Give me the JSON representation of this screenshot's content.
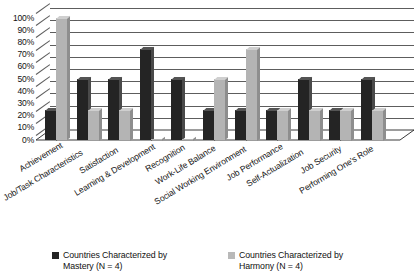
{
  "chart_data": {
    "type": "bar",
    "title": "",
    "subtitle": "",
    "xlabel": "",
    "ylabel": "",
    "ylim": [
      0,
      100
    ],
    "ytick_labels": [
      "100%",
      "90%",
      "80%",
      "70%",
      "60%",
      "50%",
      "40%",
      "30%",
      "20%",
      "10%",
      "0%"
    ],
    "ytick_values": [
      100,
      90,
      80,
      70,
      60,
      50,
      40,
      30,
      20,
      10,
      0
    ],
    "grid": true,
    "grid_axis": "y",
    "legend_position": "bottom",
    "categories": [
      "Achievement",
      "Job/Task Characteristics",
      "Satisfaction",
      "Learning & Development",
      "Recognition",
      "Work-Life Balance",
      "Social Working Environment",
      "Job Performance",
      "Self-Actualization",
      "Job Security",
      "Performing One's Role"
    ],
    "series": [
      {
        "name": "Countries Characterized by Mastery (N = 4)",
        "color": "#242424",
        "values": [
          25,
          50,
          50,
          75,
          50,
          25,
          25,
          25,
          50,
          25,
          50
        ]
      },
      {
        "name": "Countries Characterized by Harmony (N = 4)",
        "color": "#b4b4b4",
        "values": [
          100,
          25,
          25,
          0,
          0,
          50,
          75,
          25,
          25,
          25,
          25
        ]
      }
    ]
  },
  "legend": {
    "items": [
      {
        "label_line1": "Countries Characterized by",
        "label_line2": "Mastery (N = 4)",
        "swatch": "mastery-swatch"
      },
      {
        "label_line1": "Countries Characterized by",
        "label_line2": "Harmony (N = 4)",
        "swatch": "harmony-swatch"
      }
    ]
  },
  "colors": {
    "mastery": "#242424",
    "harmony": "#b4b4b4",
    "grid": "#5d5d5d",
    "background": "#ffffff",
    "text": "#111111"
  }
}
